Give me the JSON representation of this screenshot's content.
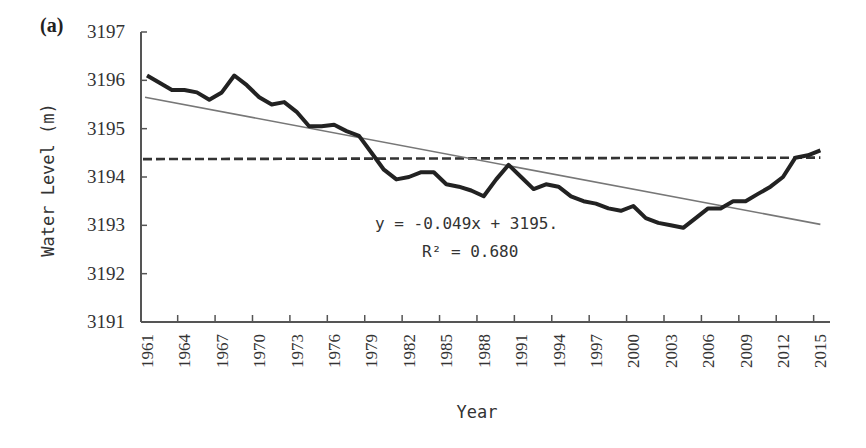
{
  "panel_label": "(a)",
  "chart_data": {
    "type": "line",
    "title": "",
    "panel": "(a)",
    "xlabel": "Year",
    "ylabel": "Water Level (m)",
    "ylim": [
      3191,
      3197
    ],
    "yticks": [
      3191,
      3192,
      3193,
      3194,
      3195,
      3196,
      3197
    ],
    "xtick_labels": [
      "1961",
      "1964",
      "1967",
      "1970",
      "1973",
      "1976",
      "1979",
      "1982",
      "1985",
      "1988",
      "1991",
      "1994",
      "1997",
      "2000",
      "2003",
      "2006",
      "2009",
      "2012",
      "2015"
    ],
    "grid": false,
    "legend": null,
    "x": [
      1961,
      1962,
      1963,
      1964,
      1965,
      1966,
      1967,
      1968,
      1969,
      1970,
      1971,
      1972,
      1973,
      1974,
      1975,
      1976,
      1977,
      1978,
      1979,
      1980,
      1981,
      1982,
      1983,
      1984,
      1985,
      1986,
      1987,
      1988,
      1989,
      1990,
      1991,
      1992,
      1993,
      1994,
      1995,
      1996,
      1997,
      1998,
      1999,
      2000,
      2001,
      2002,
      2003,
      2004,
      2005,
      2006,
      2007,
      2008,
      2009,
      2010,
      2011,
      2012,
      2013,
      2014,
      2015
    ],
    "series": [
      {
        "name": "Water level",
        "style": "solid-thick",
        "color": "#222222",
        "values": [
          3196.1,
          3195.95,
          3195.8,
          3195.8,
          3195.75,
          3195.6,
          3195.75,
          3196.1,
          3195.9,
          3195.65,
          3195.5,
          3195.55,
          3195.35,
          3195.05,
          3195.05,
          3195.08,
          3194.95,
          3194.85,
          3194.5,
          3194.15,
          3193.95,
          3194.0,
          3194.1,
          3194.1,
          3193.85,
          3193.8,
          3193.72,
          3193.6,
          3193.95,
          3194.25,
          3194.0,
          3193.75,
          3193.85,
          3193.8,
          3193.6,
          3193.5,
          3193.45,
          3193.35,
          3193.3,
          3193.4,
          3193.15,
          3193.05,
          3193.0,
          3192.95,
          3193.15,
          3193.35,
          3193.35,
          3193.5,
          3193.5,
          3193.65,
          3193.8,
          3194.0,
          3194.4,
          3194.45,
          3194.55
        ]
      },
      {
        "name": "Linear trend",
        "style": "solid-thin",
        "color": "#777777",
        "start": [
          1961,
          3195.65
        ],
        "end": [
          2015,
          3193.02
        ]
      },
      {
        "name": "Mean",
        "style": "dashed",
        "color": "#333333",
        "value": 3194.37
      }
    ],
    "annotations": [
      {
        "text": "y = -0.049x + 3195.",
        "x": 1993,
        "y": 3193.0
      },
      {
        "text": "R² = 0.680",
        "x": 1993,
        "y": 3192.55
      }
    ]
  }
}
